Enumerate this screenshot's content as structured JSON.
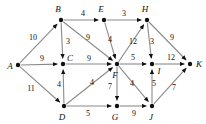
{
  "figure": {
    "kind": "directed-weighted-graph",
    "background_color": "#ffffff",
    "node_color": "#111111",
    "edge_color": "#8a8a8a",
    "label_color": "#111111",
    "width": 206,
    "height": 124
  },
  "nodes": [
    {
      "id": "A",
      "label": "A",
      "x": 18,
      "y": 65,
      "label_x": 10,
      "label_y": 66
    },
    {
      "id": "B",
      "label": "B",
      "x": 61,
      "y": 20,
      "label_x": 58,
      "label_y": 9
    },
    {
      "id": "C",
      "label": "C",
      "x": 63,
      "y": 64,
      "label_x": 70,
      "label_y": 58
    },
    {
      "id": "D",
      "label": "D",
      "x": 64,
      "y": 106,
      "label_x": 62,
      "label_y": 117
    },
    {
      "id": "E",
      "label": "E",
      "x": 104,
      "y": 20,
      "label_x": 101,
      "label_y": 9
    },
    {
      "id": "F",
      "label": "F",
      "x": 117,
      "y": 64,
      "label_x": 115,
      "label_y": 75
    },
    {
      "id": "G",
      "label": "G",
      "x": 117,
      "y": 106,
      "label_x": 115,
      "label_y": 117
    },
    {
      "id": "H",
      "label": "H",
      "x": 147,
      "y": 20,
      "label_x": 145,
      "label_y": 9
    },
    {
      "id": "I",
      "label": "I",
      "x": 152,
      "y": 64,
      "label_x": 159,
      "label_y": 71
    },
    {
      "id": "J",
      "label": "J",
      "x": 152,
      "y": 106,
      "label_x": 151,
      "label_y": 117
    },
    {
      "id": "K",
      "label": "K",
      "x": 190,
      "y": 64,
      "label_x": 199,
      "label_y": 64
    }
  ],
  "edges": [
    {
      "from": "A",
      "to": "B",
      "weight": "10",
      "label_x": 33,
      "label_y": 38
    },
    {
      "from": "A",
      "to": "C",
      "weight": "9",
      "label_x": 42,
      "label_y": 59
    },
    {
      "from": "A",
      "to": "D",
      "weight": "11",
      "label_x": 31,
      "label_y": 89
    },
    {
      "from": "B",
      "to": "E",
      "weight": "4",
      "label_x": 83,
      "label_y": 14
    },
    {
      "from": "B",
      "to": "C",
      "weight": "3",
      "label_x": 68,
      "label_y": 42
    },
    {
      "from": "B",
      "to": "F",
      "weight": "9",
      "label_x": 88,
      "label_y": 38
    },
    {
      "from": "C",
      "to": "F",
      "weight": "9",
      "label_x": 89,
      "label_y": 59
    },
    {
      "from": "D",
      "to": "C",
      "weight": "4",
      "label_x": 59,
      "label_y": 85
    },
    {
      "from": "D",
      "to": "F",
      "weight": "4",
      "label_x": 92,
      "label_y": 83
    },
    {
      "from": "D",
      "to": "G",
      "weight": "5",
      "label_x": 88,
      "label_y": 114
    },
    {
      "from": "E",
      "to": "H",
      "weight": "3",
      "label_x": 124,
      "label_y": 14
    },
    {
      "from": "E",
      "to": "F",
      "weight": "4",
      "label_x": 110,
      "label_y": 40
    },
    {
      "from": "F",
      "to": "H",
      "weight": "12",
      "label_x": 133,
      "label_y": 42
    },
    {
      "from": "F",
      "to": "I",
      "weight": "5",
      "label_x": 133,
      "label_y": 58
    },
    {
      "from": "F",
      "to": "G",
      "weight": "7",
      "label_x": 110,
      "label_y": 87
    },
    {
      "from": "F",
      "to": "J",
      "weight": "4",
      "label_x": 132,
      "label_y": 84
    },
    {
      "from": "G",
      "to": "J",
      "weight": "9",
      "label_x": 134,
      "label_y": 114
    },
    {
      "from": "H",
      "to": "I",
      "weight": "3",
      "label_x": 152,
      "label_y": 42
    },
    {
      "from": "H",
      "to": "K",
      "weight": "9",
      "label_x": 172,
      "label_y": 38
    },
    {
      "from": "I",
      "to": "K",
      "weight": "12",
      "label_x": 171,
      "label_y": 58
    },
    {
      "from": "J",
      "to": "I",
      "weight": "5",
      "label_x": 154,
      "label_y": 84
    },
    {
      "from": "J",
      "to": "K",
      "weight": "7",
      "label_x": 174,
      "label_y": 88
    }
  ]
}
